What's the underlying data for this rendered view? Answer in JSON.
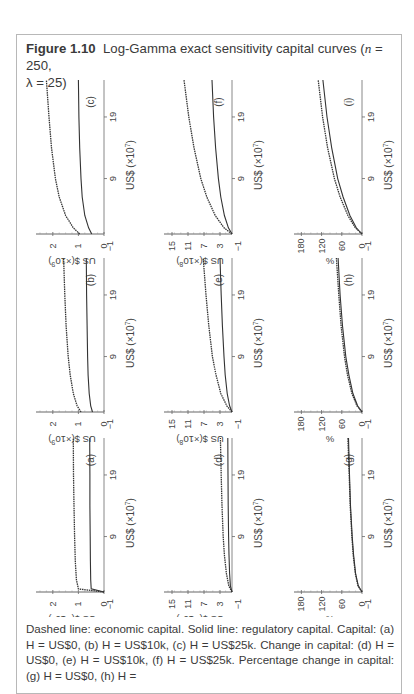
{
  "figure": {
    "label": "Figure 1.10",
    "title": "Log-Gamma exact sensitivity capital curves (n = 250, λ = 25)",
    "title_parts": {
      "pre": "Log-Gamma exact sensitivity capital curves (",
      "n": "n",
      "n_eq": " = 250,",
      "lambda": "λ = 25)"
    },
    "orientation": "rotated 90° counter-clockwise on page",
    "caption": "Dashed line: economic capital. Solid line: regulatory capital. Capital: (a) H = US$0, (b) H = US$10k, (c) H = US$25k. Change in capital: (d) H = US$0, (e) H = US$10k, (f) H = US$25k. Percentage change in capital: (g) H = US$0, (h) H ="
  },
  "chart_data": [
    {
      "panel": "(a)",
      "type": "line",
      "group": "Capital",
      "H": "US$0",
      "xlabel": "US$ (×10^7)",
      "ylabel": "US $(×10^9)",
      "xticks": [
        9,
        19
      ],
      "xlim": [
        0,
        25
      ],
      "yticks": [
        -1,
        0,
        1,
        2
      ],
      "ylim": [
        -1,
        2.5
      ],
      "series": [
        {
          "name": "Economic capital",
          "style": "dashed",
          "x": [
            0,
            0.5,
            2,
            5,
            9,
            14,
            19,
            25
          ],
          "y": [
            0,
            1.0,
            1.08,
            1.12,
            1.15,
            1.17,
            1.19,
            1.2
          ]
        },
        {
          "name": "Regulatory capital",
          "style": "solid",
          "x": [
            0,
            0.5,
            2,
            5,
            9,
            14,
            19,
            25
          ],
          "y": [
            0,
            0.5,
            0.52,
            0.53,
            0.54,
            0.55,
            0.55,
            0.56
          ]
        }
      ]
    },
    {
      "panel": "(b)",
      "type": "line",
      "group": "Capital",
      "H": "US$10k",
      "xlabel": "US$ (×10^7)",
      "ylabel": "US $(×10^9)",
      "xticks": [
        9,
        19
      ],
      "xlim": [
        0,
        25
      ],
      "yticks": [
        -1,
        0,
        1,
        2
      ],
      "ylim": [
        -1,
        2.5
      ],
      "series": [
        {
          "name": "Economic capital",
          "style": "dashed",
          "x": [
            0,
            1,
            3,
            6,
            9,
            14,
            19,
            25
          ],
          "y": [
            0.9,
            1.05,
            1.2,
            1.32,
            1.4,
            1.48,
            1.53,
            1.58
          ]
        },
        {
          "name": "Regulatory capital",
          "style": "solid",
          "x": [
            0,
            1,
            3,
            6,
            9,
            14,
            19,
            25
          ],
          "y": [
            0.45,
            0.52,
            0.58,
            0.62,
            0.64,
            0.66,
            0.68,
            0.69
          ]
        }
      ]
    },
    {
      "panel": "(c)",
      "type": "line",
      "group": "Capital",
      "H": "US$25k",
      "xlabel": "US$ (×10^7)",
      "ylabel": "US $(×10^9)",
      "xticks": [
        9,
        19
      ],
      "xlim": [
        0,
        25
      ],
      "yticks": [
        -1,
        0,
        1,
        2
      ],
      "ylim": [
        -1,
        2.5
      ],
      "series": [
        {
          "name": "Economic capital",
          "style": "dashed",
          "x": [
            0,
            1,
            3,
            6,
            9,
            14,
            19,
            25
          ],
          "y": [
            0.95,
            1.2,
            1.5,
            1.75,
            1.9,
            2.05,
            2.15,
            2.25
          ]
        },
        {
          "name": "Regulatory capital",
          "style": "solid",
          "x": [
            0,
            1,
            3,
            6,
            9,
            14,
            19,
            25
          ],
          "y": [
            0.48,
            0.6,
            0.75,
            0.85,
            0.9,
            0.95,
            0.98,
            1.0
          ]
        }
      ]
    },
    {
      "panel": "(d)",
      "type": "line",
      "group": "Change in capital",
      "H": "US$0",
      "xlabel": "US$ (×10^7)",
      "ylabel": "US $(×10^8)",
      "xticks": [
        9,
        19
      ],
      "xlim": [
        0,
        25
      ],
      "yticks": [
        -1,
        3,
        7,
        11,
        15
      ],
      "ylim": [
        -1,
        16
      ],
      "series": [
        {
          "name": "Economic capital",
          "style": "dashed",
          "x": [
            0,
            1,
            3,
            6,
            9,
            14,
            19,
            25
          ],
          "y": [
            0,
            0.8,
            1.4,
            1.9,
            2.2,
            2.5,
            2.7,
            2.9
          ]
        },
        {
          "name": "Regulatory capital",
          "style": "solid",
          "x": [
            0,
            1,
            3,
            6,
            9,
            14,
            19,
            25
          ],
          "y": [
            0,
            0.4,
            0.6,
            0.75,
            0.85,
            0.95,
            1.0,
            1.05
          ]
        }
      ]
    },
    {
      "panel": "(e)",
      "type": "line",
      "group": "Change in capital",
      "H": "US$10k",
      "xlabel": "US$ (×10^7)",
      "ylabel": "US $(×10^8)",
      "xticks": [
        9,
        19
      ],
      "xlim": [
        0,
        25
      ],
      "yticks": [
        -1,
        3,
        7,
        11,
        15
      ],
      "ylim": [
        -1,
        16
      ],
      "series": [
        {
          "name": "Economic capital",
          "style": "dashed",
          "x": [
            0,
            1,
            3,
            6,
            9,
            14,
            19,
            25
          ],
          "y": [
            0,
            1.3,
            2.8,
            4.0,
            4.9,
            5.8,
            6.5,
            7.2
          ]
        },
        {
          "name": "Regulatory capital",
          "style": "solid",
          "x": [
            0,
            1,
            3,
            6,
            9,
            14,
            19,
            25
          ],
          "y": [
            0,
            0.6,
            1.2,
            1.7,
            2.0,
            2.4,
            2.7,
            3.0
          ]
        }
      ]
    },
    {
      "panel": "(f)",
      "type": "line",
      "group": "Change in capital",
      "H": "US$25k",
      "xlabel": "US$ (×10^7)",
      "ylabel": "US $(×10^8)",
      "xticks": [
        9,
        19
      ],
      "xlim": [
        0,
        25
      ],
      "yticks": [
        -1,
        3,
        7,
        11,
        15
      ],
      "ylim": [
        -1,
        16
      ],
      "series": [
        {
          "name": "Economic capital",
          "style": "dashed",
          "x": [
            0,
            1,
            3,
            6,
            9,
            14,
            19,
            25
          ],
          "y": [
            0,
            2.0,
            4.2,
            6.3,
            7.8,
            9.5,
            10.8,
            12.0
          ]
        },
        {
          "name": "Regulatory capital",
          "style": "solid",
          "x": [
            0,
            1,
            3,
            6,
            9,
            14,
            19,
            25
          ],
          "y": [
            0,
            0.9,
            1.9,
            2.8,
            3.4,
            4.1,
            4.6,
            5.0
          ]
        }
      ]
    },
    {
      "panel": "(g)",
      "type": "line",
      "group": "Percentage change in capital",
      "H": "US$0",
      "xlabel": "US$ (×10^7)",
      "ylabel": "%",
      "xticks": [
        9,
        19
      ],
      "xlim": [
        0,
        25
      ],
      "yticks": [
        -1,
        0,
        60,
        120,
        180
      ],
      "ylim": [
        -1,
        190
      ],
      "series": [
        {
          "name": "Economic capital",
          "style": "dashed",
          "x": [
            0,
            1,
            3,
            6,
            9,
            14,
            19,
            25
          ],
          "y": [
            0,
            12,
            20,
            26,
            30,
            35,
            38,
            42
          ]
        },
        {
          "name": "Regulatory capital",
          "style": "solid",
          "x": [
            0,
            1,
            3,
            6,
            9,
            14,
            19,
            25
          ],
          "y": [
            0,
            11,
            19,
            25,
            29,
            34,
            37,
            40
          ]
        }
      ]
    },
    {
      "panel": "(h)",
      "type": "line",
      "group": "Percentage change in capital",
      "H": "US$10k",
      "xlabel": "US$ (×10^7)",
      "ylabel": "%",
      "xticks": [
        9,
        19
      ],
      "xlim": [
        0,
        25
      ],
      "yticks": [
        -1,
        0,
        60,
        120,
        180
      ],
      "ylim": [
        -1,
        190
      ],
      "series": [
        {
          "name": "Economic capital",
          "style": "dashed",
          "x": [
            0,
            1,
            3,
            6,
            9,
            14,
            19,
            25
          ],
          "y": [
            0,
            15,
            30,
            43,
            52,
            62,
            69,
            76
          ]
        },
        {
          "name": "Regulatory capital",
          "style": "solid",
          "x": [
            0,
            1,
            3,
            6,
            9,
            14,
            19,
            25
          ],
          "y": [
            0,
            13,
            27,
            39,
            48,
            58,
            65,
            71
          ]
        }
      ]
    },
    {
      "panel": "(i)",
      "type": "line",
      "group": "Percentage change in capital",
      "H": "",
      "xlabel": "US$ (×10^7)",
      "ylabel": "%",
      "xticks": [
        9,
        19
      ],
      "xlim": [
        0,
        25
      ],
      "yticks": [
        -1,
        0,
        60,
        120,
        180
      ],
      "ylim": [
        -1,
        190
      ],
      "series": [
        {
          "name": "Economic capital",
          "style": "dashed",
          "x": [
            0,
            1,
            3,
            6,
            9,
            14,
            19,
            25
          ],
          "y": [
            0,
            20,
            42,
            65,
            82,
            102,
            117,
            130
          ]
        },
        {
          "name": "Regulatory capital",
          "style": "solid",
          "x": [
            0,
            1,
            3,
            6,
            9,
            14,
            19,
            25
          ],
          "y": [
            0,
            17,
            36,
            56,
            72,
            90,
            104,
            116
          ]
        }
      ]
    }
  ]
}
